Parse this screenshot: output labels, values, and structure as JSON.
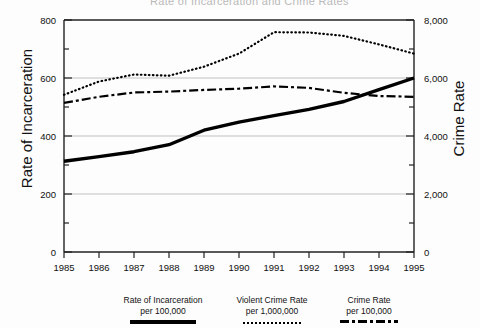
{
  "title": "Rate of Incarceration and Crime Rates",
  "axes": {
    "left_label": "Rate of Incarceration",
    "right_label": "Crime Rate",
    "left_ticks": [
      "0",
      "200",
      "400",
      "600",
      "800"
    ],
    "right_ticks": [
      "0",
      "2,000",
      "4,000",
      "6,000",
      "8,000"
    ],
    "x_ticks": [
      "1985",
      "1986",
      "1987",
      "1988",
      "1989",
      "1990",
      "1991",
      "1992",
      "1993",
      "1994",
      "1995"
    ]
  },
  "legend": [
    {
      "line1": "Rate of Incarceration",
      "line2": "per 100,000",
      "style": "solid"
    },
    {
      "line1": "Violent Crime Rate",
      "line2": "per 1,000,000",
      "style": "dotted"
    },
    {
      "line1": "Crime Rate",
      "line2": "per 100,000",
      "style": "dashdot"
    }
  ],
  "chart_data": {
    "type": "line",
    "title": "Rate of Incarceration and Crime Rates",
    "xlabel": "",
    "ylabel": "Rate of Incarceration",
    "y2label": "Crime Rate",
    "x": [
      1985,
      1986,
      1987,
      1988,
      1989,
      1990,
      1991,
      1992,
      1993,
      1994,
      1995
    ],
    "ylim": [
      0,
      800
    ],
    "y2lim": [
      0,
      8000
    ],
    "grid": true,
    "legend_position": "below",
    "series": [
      {
        "name": "Rate of Incarceration per 100,000",
        "axis": "left",
        "style": "solid",
        "color": "#000000",
        "values": [
          313,
          329,
          346,
          370,
          420,
          448,
          470,
          492,
          519,
          560,
          600
        ]
      },
      {
        "name": "Violent Crime Rate per 1,000,000",
        "axis": "right",
        "style": "dotted",
        "color": "#000000",
        "values": [
          5420,
          5880,
          6120,
          6080,
          6390,
          6840,
          7580,
          7570,
          7450,
          7160,
          6840
        ]
      },
      {
        "name": "Crime Rate per 100,000",
        "axis": "right",
        "style": "dashdot",
        "color": "#000000",
        "values": [
          5140,
          5350,
          5500,
          5530,
          5590,
          5630,
          5710,
          5660,
          5490,
          5380,
          5350
        ]
      }
    ]
  }
}
